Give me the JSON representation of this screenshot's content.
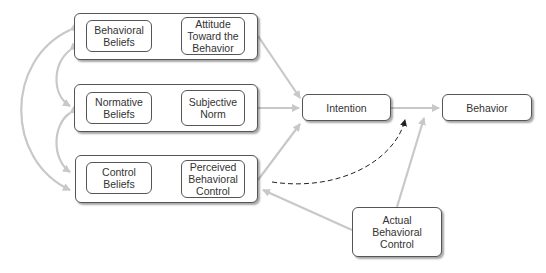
{
  "diagram": {
    "groups": [
      {
        "id": "attitude-group",
        "belief": "Behavioral\nBeliefs",
        "construct": "Attitude\nToward the\nBehavior"
      },
      {
        "id": "norm-group",
        "belief": "Normative\nBeliefs",
        "construct": "Subjective\nNorm"
      },
      {
        "id": "control-group",
        "belief": "Control\nBeliefs",
        "construct": "Perceived\nBehavioral\nControl"
      }
    ],
    "intention": "Intention",
    "behavior": "Behavior",
    "actual_control": "Actual\nBehavioral\nControl"
  },
  "colors": {
    "gray_arrow": "#c8c8c8",
    "dark_arrow": "#222222",
    "border": "#555555"
  }
}
